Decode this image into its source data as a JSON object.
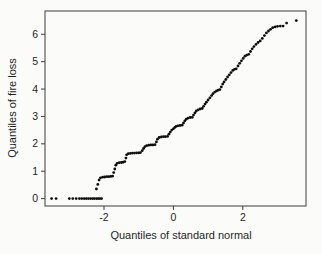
{
  "figure": {
    "background": "#fbfbf9",
    "frame_color": "#3c3c3c",
    "tick_color": "#3c3c3c",
    "point_color": "#0e0e0e",
    "text_color": "#1f1f1f"
  },
  "chart_data": {
    "type": "scatter",
    "title": "",
    "xlabel": "Quantiles of standard normal",
    "ylabel": "Quantiles of fire loss",
    "xlim": [
      -3.7,
      3.82
    ],
    "ylim": [
      -0.27,
      6.85
    ],
    "xticks": [
      -2,
      0,
      2
    ],
    "yticks": [
      0,
      1,
      2,
      3,
      4,
      5,
      6
    ],
    "grid": false,
    "legend": null,
    "marker": "dot",
    "points": [
      [
        -3.51,
        0
      ],
      [
        -3.38,
        0
      ],
      [
        -3.0,
        0
      ],
      [
        -2.9,
        0
      ],
      [
        -2.8,
        0
      ],
      [
        -2.71,
        0
      ],
      [
        -2.64,
        0
      ],
      [
        -2.57,
        0
      ],
      [
        -2.51,
        0
      ],
      [
        -2.45,
        0
      ],
      [
        -2.39,
        0
      ],
      [
        -2.33,
        0
      ],
      [
        -2.28,
        0
      ],
      [
        -2.22,
        0
      ],
      [
        -2.17,
        0
      ],
      [
        -2.12,
        0
      ],
      [
        -2.07,
        0
      ],
      [
        -2.22,
        0.35
      ],
      [
        -2.18,
        0.52
      ],
      [
        -2.14,
        0.68
      ],
      [
        -2.1,
        0.76
      ],
      [
        -2.04,
        0.78
      ],
      [
        -1.98,
        0.79
      ],
      [
        -1.92,
        0.8
      ],
      [
        -1.86,
        0.8
      ],
      [
        -1.8,
        0.81
      ],
      [
        -1.75,
        0.82
      ],
      [
        -1.72,
        0.95
      ],
      [
        -1.69,
        1.08
      ],
      [
        -1.66,
        1.22
      ],
      [
        -1.62,
        1.29
      ],
      [
        -1.56,
        1.31
      ],
      [
        -1.5,
        1.32
      ],
      [
        -1.45,
        1.33
      ],
      [
        -1.4,
        1.35
      ],
      [
        -1.37,
        1.48
      ],
      [
        -1.35,
        1.6
      ],
      [
        -1.3,
        1.64
      ],
      [
        -1.24,
        1.65
      ],
      [
        -1.18,
        1.66
      ],
      [
        -1.12,
        1.66
      ],
      [
        -1.06,
        1.67
      ],
      [
        -1.0,
        1.67
      ],
      [
        -0.95,
        1.68
      ],
      [
        -0.9,
        1.75
      ],
      [
        -0.86,
        1.83
      ],
      [
        -0.82,
        1.9
      ],
      [
        -0.77,
        1.93
      ],
      [
        -0.71,
        1.95
      ],
      [
        -0.65,
        1.96
      ],
      [
        -0.59,
        1.96
      ],
      [
        -0.53,
        1.97
      ],
      [
        -0.49,
        2.07
      ],
      [
        -0.46,
        2.17
      ],
      [
        -0.41,
        2.23
      ],
      [
        -0.35,
        2.25
      ],
      [
        -0.29,
        2.26
      ],
      [
        -0.23,
        2.26
      ],
      [
        -0.17,
        2.27
      ],
      [
        -0.13,
        2.35
      ],
      [
        -0.09,
        2.43
      ],
      [
        -0.05,
        2.5
      ],
      [
        0.0,
        2.55
      ],
      [
        0.04,
        2.6
      ],
      [
        0.08,
        2.64
      ],
      [
        0.13,
        2.66
      ],
      [
        0.19,
        2.67
      ],
      [
        0.25,
        2.68
      ],
      [
        0.29,
        2.76
      ],
      [
        0.33,
        2.84
      ],
      [
        0.37,
        2.9
      ],
      [
        0.42,
        2.94
      ],
      [
        0.48,
        2.96
      ],
      [
        0.54,
        2.97
      ],
      [
        0.58,
        3.05
      ],
      [
        0.62,
        3.13
      ],
      [
        0.66,
        3.2
      ],
      [
        0.71,
        3.24
      ],
      [
        0.77,
        3.27
      ],
      [
        0.83,
        3.29
      ],
      [
        0.87,
        3.37
      ],
      [
        0.91,
        3.45
      ],
      [
        0.95,
        3.52
      ],
      [
        1.0,
        3.6
      ],
      [
        1.05,
        3.68
      ],
      [
        1.1,
        3.76
      ],
      [
        1.14,
        3.83
      ],
      [
        1.19,
        3.89
      ],
      [
        1.24,
        3.93
      ],
      [
        1.29,
        3.96
      ],
      [
        1.34,
        3.98
      ],
      [
        1.38,
        4.08
      ],
      [
        1.42,
        4.18
      ],
      [
        1.46,
        4.26
      ],
      [
        1.51,
        4.35
      ],
      [
        1.56,
        4.44
      ],
      [
        1.61,
        4.52
      ],
      [
        1.66,
        4.6
      ],
      [
        1.71,
        4.68
      ],
      [
        1.76,
        4.72
      ],
      [
        1.81,
        4.74
      ],
      [
        1.86,
        4.84
      ],
      [
        1.91,
        4.94
      ],
      [
        1.96,
        5.03
      ],
      [
        2.01,
        5.12
      ],
      [
        2.06,
        5.2
      ],
      [
        2.11,
        5.24
      ],
      [
        2.17,
        5.27
      ],
      [
        2.22,
        5.37
      ],
      [
        2.27,
        5.47
      ],
      [
        2.32,
        5.55
      ],
      [
        2.38,
        5.63
      ],
      [
        2.44,
        5.7
      ],
      [
        2.5,
        5.76
      ],
      [
        2.56,
        5.85
      ],
      [
        2.62,
        5.95
      ],
      [
        2.68,
        6.05
      ],
      [
        2.74,
        6.12
      ],
      [
        2.8,
        6.18
      ],
      [
        2.86,
        6.24
      ],
      [
        2.93,
        6.27
      ],
      [
        3.0,
        6.29
      ],
      [
        3.08,
        6.3
      ],
      [
        3.16,
        6.3
      ],
      [
        3.26,
        6.41
      ],
      [
        3.54,
        6.5
      ]
    ]
  }
}
